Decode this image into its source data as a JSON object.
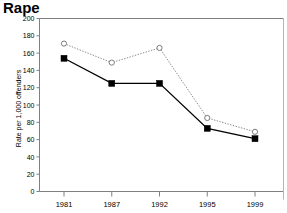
{
  "chart_data": {
    "type": "line",
    "title": "Rape",
    "xlabel": "",
    "ylabel": "Rate per 1,000 offenders",
    "categories": [
      "1981",
      "1987",
      "1992",
      "1995",
      "1999"
    ],
    "ylim": [
      0,
      200
    ],
    "yticks": [
      0,
      20,
      40,
      60,
      80,
      100,
      120,
      140,
      160,
      180,
      200
    ],
    "ytick_labels": [
      "0",
      "20",
      "40",
      "60",
      "80",
      "100",
      "120",
      "140",
      "160",
      "180",
      "200"
    ],
    "grid": false,
    "legend_position": "none",
    "series": [
      {
        "name": "upper-dotted-series",
        "style": "dotted",
        "marker": "open-circle",
        "color": "#8a8a8a",
        "values": [
          171,
          149,
          166,
          85,
          69
        ]
      },
      {
        "name": "lower-solid-series",
        "style": "solid",
        "marker": "filled-square",
        "color": "#000000",
        "values": [
          154,
          125,
          125,
          73,
          61
        ]
      }
    ]
  }
}
